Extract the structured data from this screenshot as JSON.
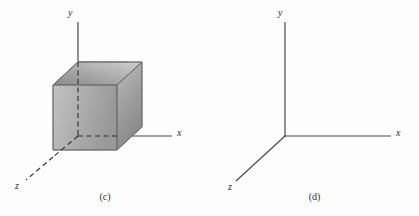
{
  "figure": {
    "background_color": "#fdfdfd",
    "axis_color": "#4a4a4a",
    "label_color": "#2b2b2b",
    "panels": [
      {
        "id": "c",
        "caption": "(c)",
        "description": "three-dimensional coordinate axes with shaded cube drawn in the octant between the y axis and the z axis, axes shown dashed where hidden behind the cube",
        "has_cube": true,
        "axes": [
          {
            "name": "y",
            "label": "y",
            "direction": "up"
          },
          {
            "name": "x",
            "label": "x",
            "direction": "right"
          },
          {
            "name": "z",
            "label": "z",
            "direction": "down-left"
          }
        ],
        "cube": {
          "shape": "cube",
          "visible_faces": [
            "top",
            "left",
            "front-right"
          ],
          "shading": "grey-gradient",
          "colors": {
            "top_face_light": "#c9c9c9",
            "top_face_dark": "#8f8f8f",
            "left_face_light": "#bdbdbd",
            "left_face_dark": "#9a9a9a",
            "front_face_light": "#b8b8b8",
            "front_face_dark": "#8c8c8c",
            "edge": "#6f6f6f"
          }
        }
      },
      {
        "id": "d",
        "caption": "(d)",
        "description": "three-dimensional coordinate axes only, no cube drawn",
        "has_cube": false,
        "axes": [
          {
            "name": "y",
            "label": "y",
            "direction": "up"
          },
          {
            "name": "x",
            "label": "x",
            "direction": "right"
          },
          {
            "name": "z",
            "label": "z",
            "direction": "down-left"
          }
        ]
      }
    ]
  }
}
